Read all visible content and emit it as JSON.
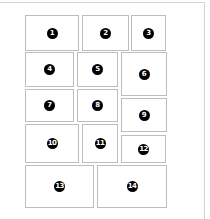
{
  "diagram": {
    "title": "",
    "boxes": [
      {
        "label": "1",
        "x": 25,
        "y": 15,
        "w": 54,
        "h": 36
      },
      {
        "label": "2",
        "x": 82,
        "y": 15,
        "w": 47,
        "h": 36
      },
      {
        "label": "3",
        "x": 131,
        "y": 15,
        "w": 35,
        "h": 36
      },
      {
        "label": "4",
        "x": 25,
        "y": 52,
        "w": 49,
        "h": 35
      },
      {
        "label": "5",
        "x": 77,
        "y": 52,
        "w": 41,
        "h": 35
      },
      {
        "label": "6",
        "x": 121,
        "y": 52,
        "w": 46,
        "h": 44
      },
      {
        "label": "7",
        "x": 25,
        "y": 89,
        "w": 49,
        "h": 33
      },
      {
        "label": "8",
        "x": 77,
        "y": 89,
        "w": 41,
        "h": 33
      },
      {
        "label": "9",
        "x": 121,
        "y": 98,
        "w": 46,
        "h": 34
      },
      {
        "label": "10",
        "x": 25,
        "y": 124,
        "w": 54,
        "h": 39
      },
      {
        "label": "11",
        "x": 82,
        "y": 124,
        "w": 36,
        "h": 39
      },
      {
        "label": "12",
        "x": 121,
        "y": 135,
        "w": 45,
        "h": 28
      },
      {
        "label": "13",
        "x": 25,
        "y": 165,
        "w": 69,
        "h": 43
      },
      {
        "label": "14",
        "x": 97,
        "y": 165,
        "w": 70,
        "h": 43
      }
    ],
    "colors": {
      "box_border": "#bdbdbd",
      "frame_border": "#d4d4d4",
      "badge_fill": "#000000",
      "badge_text": "#ffffff"
    }
  }
}
